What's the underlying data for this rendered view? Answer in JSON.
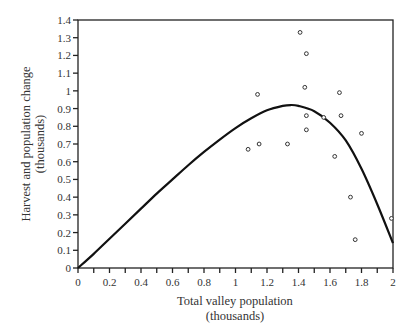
{
  "chart_data": {
    "type": "scatter",
    "title": "",
    "xlabel": "Total valley population",
    "xlabel_units": "(thousands)",
    "ylabel": "Harvest and population change",
    "ylabel_units": "(thousands)",
    "xlim": [
      0,
      2
    ],
    "ylim": [
      0,
      1.4
    ],
    "grid": false,
    "legend": null,
    "x_ticks": [
      0,
      0.2,
      0.4,
      0.6,
      0.8,
      1,
      1.2,
      1.4,
      1.6,
      1.8,
      2
    ],
    "x_tick_labels": [
      "0",
      "0.2",
      "0.4",
      "0.6",
      "0.8",
      "1",
      "1.2",
      "1.4",
      "1.6",
      "1.8",
      "2"
    ],
    "x_minor_ticks": [
      0.1,
      0.3,
      0.5,
      0.7,
      0.9,
      1.1,
      1.3,
      1.5,
      1.7,
      1.9
    ],
    "y_ticks": [
      0,
      0.1,
      0.2,
      0.3,
      0.4,
      0.5,
      0.6,
      0.7,
      0.8,
      0.9,
      1,
      1.1,
      1.2,
      1.3,
      1.4
    ],
    "y_tick_labels": [
      "0",
      "0.1",
      "0.2",
      "0.3",
      "0.4",
      "0.5",
      "0.6",
      "0.7",
      "0.8",
      "0.9",
      "1",
      "1.1",
      "1.2",
      "1.3",
      "1.4"
    ],
    "series": [
      {
        "name": "Observed harvest",
        "type": "scatter",
        "marker": "open-circle",
        "points": [
          {
            "x": 1.08,
            "y": 0.67
          },
          {
            "x": 1.15,
            "y": 0.7
          },
          {
            "x": 1.14,
            "y": 0.98
          },
          {
            "x": 1.33,
            "y": 0.7
          },
          {
            "x": 1.41,
            "y": 1.33
          },
          {
            "x": 1.45,
            "y": 1.21
          },
          {
            "x": 1.44,
            "y": 1.02
          },
          {
            "x": 1.45,
            "y": 0.86
          },
          {
            "x": 1.45,
            "y": 0.78
          },
          {
            "x": 1.56,
            "y": 0.85
          },
          {
            "x": 1.66,
            "y": 0.99
          },
          {
            "x": 1.67,
            "y": 0.86
          },
          {
            "x": 1.63,
            "y": 0.63
          },
          {
            "x": 1.8,
            "y": 0.76
          },
          {
            "x": 1.73,
            "y": 0.4
          },
          {
            "x": 1.76,
            "y": 0.16
          },
          {
            "x": 1.99,
            "y": 0.28
          }
        ]
      },
      {
        "name": "Population change curve",
        "type": "line",
        "points": [
          {
            "x": 0,
            "y": 0
          },
          {
            "x": 0.1,
            "y": 0.08
          },
          {
            "x": 0.2,
            "y": 0.165
          },
          {
            "x": 0.3,
            "y": 0.25
          },
          {
            "x": 0.4,
            "y": 0.335
          },
          {
            "x": 0.5,
            "y": 0.42
          },
          {
            "x": 0.6,
            "y": 0.5
          },
          {
            "x": 0.7,
            "y": 0.58
          },
          {
            "x": 0.8,
            "y": 0.655
          },
          {
            "x": 0.9,
            "y": 0.725
          },
          {
            "x": 1.0,
            "y": 0.79
          },
          {
            "x": 1.1,
            "y": 0.845
          },
          {
            "x": 1.2,
            "y": 0.89
          },
          {
            "x": 1.3,
            "y": 0.915
          },
          {
            "x": 1.35,
            "y": 0.92
          },
          {
            "x": 1.4,
            "y": 0.915
          },
          {
            "x": 1.5,
            "y": 0.885
          },
          {
            "x": 1.6,
            "y": 0.82
          },
          {
            "x": 1.7,
            "y": 0.72
          },
          {
            "x": 1.8,
            "y": 0.56
          },
          {
            "x": 1.9,
            "y": 0.36
          },
          {
            "x": 2.0,
            "y": 0.14
          }
        ]
      }
    ]
  },
  "style": {
    "line_color": "#111111",
    "axis_color": "#222222",
    "marker_color": "#333333",
    "background": "#ffffff"
  }
}
